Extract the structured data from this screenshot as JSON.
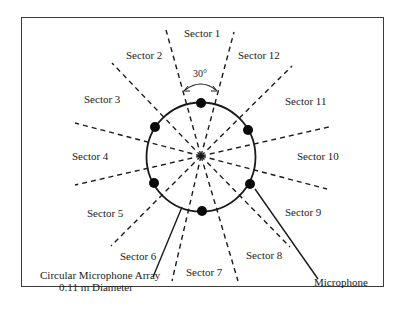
{
  "diagram": {
    "angle_label": "30°",
    "sectors": [
      {
        "id": 1,
        "label": "Sector 1"
      },
      {
        "id": 2,
        "label": "Sector 2"
      },
      {
        "id": 3,
        "label": "Sector 3"
      },
      {
        "id": 4,
        "label": "Sector 4"
      },
      {
        "id": 5,
        "label": "Sector 5"
      },
      {
        "id": 6,
        "label": "Sector 6"
      },
      {
        "id": 7,
        "label": "Sector 7"
      },
      {
        "id": 8,
        "label": "Sector 8"
      },
      {
        "id": 9,
        "label": "Sector 9"
      },
      {
        "id": 10,
        "label": "Sector 10"
      },
      {
        "id": 11,
        "label": "Sector 11"
      },
      {
        "id": 12,
        "label": "Sector  12"
      }
    ],
    "array_label_line1": "Circular Microphone Array",
    "array_label_line2": "0.11 m Diameter",
    "microphone_label": "Microphone",
    "microphone_count": 6,
    "colors": {
      "line": "#1a1a1a",
      "frame": "#3a3a3a"
    }
  }
}
